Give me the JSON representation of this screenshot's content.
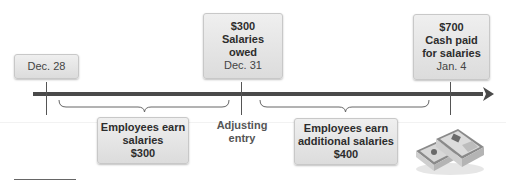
{
  "diagram": {
    "type": "timeline",
    "colors": {
      "timeline": "#4a4a4a",
      "box_fill_top": "#efefef",
      "box_fill_bottom": "#dcdcdc",
      "text": "#333333"
    },
    "top_boxes": [
      {
        "id": "dec28",
        "lines": [
          "Dec. 28"
        ]
      },
      {
        "id": "dec31",
        "amount": "$300",
        "title_line1": "Salaries",
        "title_line2": "owed",
        "date": "Dec. 31"
      },
      {
        "id": "jan4",
        "amount": "$700",
        "title_line1": "Cash paid",
        "title_line2": "for salaries",
        "date": "Jan. 4"
      }
    ],
    "bottom_boxes": [
      {
        "id": "earn1",
        "line1": "Employees earn",
        "line2": "salaries",
        "amount": "$300"
      },
      {
        "id": "earn2",
        "line1": "Employees earn",
        "line2": "additional salaries",
        "amount": "$400"
      }
    ],
    "adjusting_label": {
      "line1": "Adjusting",
      "line2": "entry"
    },
    "image": {
      "icon": "money-stack-icon",
      "description": "stacks of cash"
    }
  }
}
